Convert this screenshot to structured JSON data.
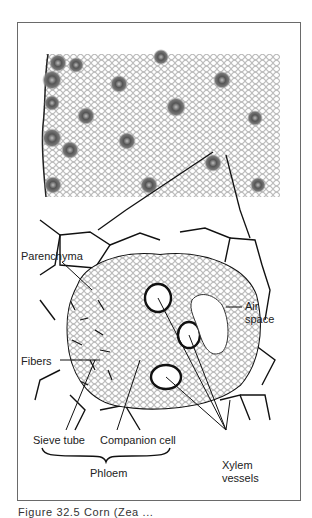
{
  "figure": {
    "caption": "Figure 32.5  Corn (Zea ..."
  },
  "micrograph": {
    "title": "Stem cross section with scattered vascular bundles"
  },
  "labels": {
    "parenchyma": "Parenchyma",
    "air_space_line1": "Air",
    "air_space_line2": "space",
    "fibers": "Fibers",
    "sieve_tube": "Sieve tube",
    "companion_cell": "Companion cell",
    "phloem": "Phloem",
    "xylem_line1": "Xylem",
    "xylem_line2": "vessels"
  },
  "colors": {
    "ink": "#1a1a1a",
    "frame": "#6a6a6a",
    "background": "#ffffff"
  }
}
